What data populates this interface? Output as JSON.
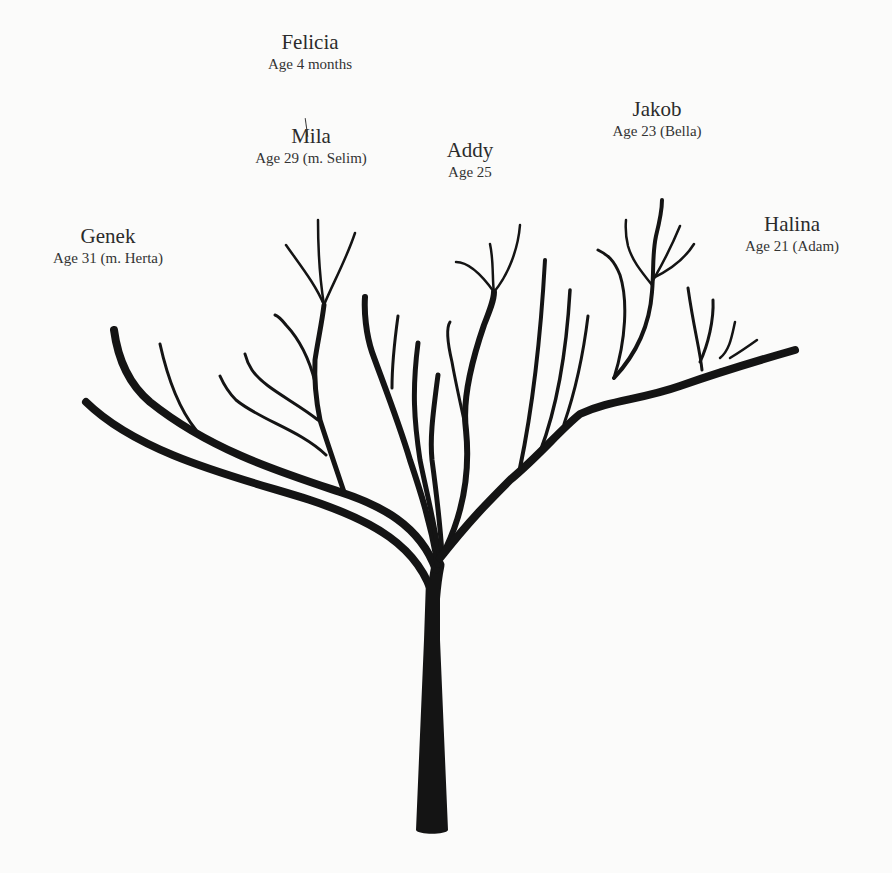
{
  "diagram": {
    "type": "family-tree",
    "ink_color": "#141414",
    "background": "#fbfbfa",
    "people": [
      {
        "id": "felicia",
        "name": "Felicia",
        "age": "Age 4 months",
        "x": 310,
        "y": 54
      },
      {
        "id": "mila",
        "name": "Mila",
        "age": "Age 29 (m. Selim)",
        "x": 311,
        "y": 148
      },
      {
        "id": "addy",
        "name": "Addy",
        "age": "Age 25",
        "x": 470,
        "y": 162
      },
      {
        "id": "jakob",
        "name": "Jakob",
        "age": "Age 23 (Bella)",
        "x": 657,
        "y": 121
      },
      {
        "id": "genek",
        "name": "Genek",
        "age": "Age 31 (m. Herta)",
        "x": 108,
        "y": 248
      },
      {
        "id": "halina",
        "name": "Halina",
        "age": "Age 21 (Adam)",
        "x": 792,
        "y": 236
      }
    ],
    "connectors": [
      {
        "from": "mila",
        "to": "felicia",
        "x": 306,
        "y": 118
      }
    ],
    "trunk": {
      "path": "M416,830 C418,835 446,835 448,830 L440,640 L440,580 L426,580 L424,640 Z"
    },
    "branches": [
      {
        "group": "trunk-upper",
        "w": 13,
        "d": "M432,640 C432,610 434,585 438,565"
      },
      {
        "group": "genek",
        "w": 8,
        "d": "M434,600 C420,545 370,520 310,500 C240,478 140,455 86,402"
      },
      {
        "group": "genek",
        "w": 8,
        "d": "M436,570 C420,525 380,505 340,492 C280,472 210,450 150,402 C130,385 118,360 114,330"
      },
      {
        "group": "genek",
        "w": 3,
        "d": "M196,430 C180,410 168,380 160,344"
      },
      {
        "group": "mila",
        "w": 5,
        "d": "M344,492 C336,468 328,445 320,420 C316,400 314,380 315,360 C318,340 322,322 324,305"
      },
      {
        "group": "mila",
        "w": 3,
        "d": "M326,455 C300,430 260,420 236,400 C228,392 224,385 220,376"
      },
      {
        "group": "mila",
        "w": 3,
        "d": "M318,420 C296,402 264,388 252,370 C248,364 246,358 245,354"
      },
      {
        "group": "mila",
        "w": 3,
        "d": "M315,382 C310,362 300,340 286,325 C282,320 278,316 275,315"
      },
      {
        "group": "mila",
        "w": 2.5,
        "d": "M324,305 C320,280 318,250 318,220"
      },
      {
        "group": "mila",
        "w": 2.5,
        "d": "M324,305 C316,285 300,265 286,245"
      },
      {
        "group": "mila",
        "w": 2.5,
        "d": "M324,305 C332,285 346,260 355,233"
      },
      {
        "group": "center",
        "w": 6,
        "d": "M438,565 C430,520 420,490 410,460 C398,420 382,380 372,352 C366,334 364,312 365,297"
      },
      {
        "group": "center",
        "w": 3,
        "d": "M392,388 C392,370 394,345 398,316"
      },
      {
        "group": "center",
        "w": 5,
        "d": "M440,560 C434,520 426,490 420,460 C414,420 412,390 418,343"
      },
      {
        "group": "center",
        "w": 5,
        "d": "M442,555 C440,520 436,490 432,460 C430,440 432,420 438,375"
      },
      {
        "group": "addy",
        "w": 6,
        "d": "M446,548 C464,510 470,470 466,430 C462,400 472,360 484,325 C490,310 494,300 494,292"
      },
      {
        "group": "addy",
        "w": 3,
        "d": "M466,430 C462,410 456,385 452,362 C448,345 446,328 450,322"
      },
      {
        "group": "addy",
        "w": 2.5,
        "d": "M494,292 C484,278 470,262 456,262"
      },
      {
        "group": "addy",
        "w": 2.5,
        "d": "M494,292 C492,280 494,262 490,244"
      },
      {
        "group": "addy",
        "w": 2.5,
        "d": "M494,292 C508,275 518,250 520,225"
      },
      {
        "group": "right-main",
        "w": 8,
        "d": "M440,558 C470,520 490,500 510,480 C540,455 560,430 580,414 C610,400 640,400 680,386 C720,372 760,360 795,350"
      },
      {
        "group": "center-right",
        "w": 4,
        "d": "M520,468 C530,420 540,350 545,260"
      },
      {
        "group": "center-right",
        "w": 3.5,
        "d": "M540,452 C556,410 566,360 570,290"
      },
      {
        "group": "center-right",
        "w": 3,
        "d": "M564,424 C574,395 582,365 588,316"
      },
      {
        "group": "jakob",
        "w": 4,
        "d": "M614,378 C640,350 650,320 652,292 C654,270 652,255 656,236 C660,220 662,210 662,200"
      },
      {
        "group": "jakob",
        "w": 3,
        "d": "M614,378 C626,340 628,300 620,275 C614,260 608,255 598,250"
      },
      {
        "group": "jakob",
        "w": 2.5,
        "d": "M652,285 C640,270 632,260 628,246 C626,238 625,232 626,220"
      },
      {
        "group": "jakob",
        "w": 2.5,
        "d": "M652,282 C660,268 668,255 680,226"
      },
      {
        "group": "jakob",
        "w": 2.5,
        "d": "M653,278 C670,270 684,260 694,244"
      },
      {
        "group": "halina",
        "w": 3,
        "d": "M702,370 C700,350 694,330 688,288"
      },
      {
        "group": "halina",
        "w": 3,
        "d": "M700,362 C708,345 714,320 713,300"
      },
      {
        "group": "halina",
        "w": 2.5,
        "d": "M720,358 C730,350 732,335 735,322"
      },
      {
        "group": "halina",
        "w": 2.5,
        "d": "M730,358 C740,352 750,345 757,340"
      },
      {
        "group": "halina",
        "w": 2.5,
        "d": "M720,370 C750,362 780,356 795,348"
      }
    ]
  }
}
